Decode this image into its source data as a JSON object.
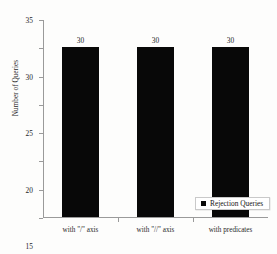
{
  "chart_data": {
    "type": "bar",
    "title": "",
    "xlabel": "",
    "ylabel": "Number of Queries",
    "categories": [
      "with \"/\" axis",
      "with \"//\" axis",
      "with predicates"
    ],
    "series": [
      {
        "name": "Rejection Queries",
        "values": [
          30,
          30,
          30
        ],
        "color": "#080808"
      }
    ],
    "value_labels": [
      "30",
      "30",
      "30"
    ],
    "ylim": [
      0,
      35
    ],
    "ytick_values": [
      0,
      5,
      10,
      15,
      20,
      25,
      30,
      35
    ],
    "ytick_labels": [
      "0",
      "5",
      "10",
      "15",
      "20",
      "25",
      "30",
      "35"
    ],
    "grid": false,
    "legend": {
      "position": "inside-center-lower",
      "entries": [
        {
          "label": "Rejection Queries",
          "marker": "square",
          "color": "#080808"
        }
      ]
    },
    "axis_color": "#9a9a9a"
  }
}
